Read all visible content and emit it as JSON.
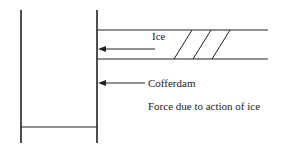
{
  "diagram": {
    "labels": {
      "ice": "Ice",
      "cofferdam": "Cofferdam",
      "caption": "Force due to action of ice"
    },
    "colors": {
      "line": "#222222",
      "background": "#ffffff"
    }
  }
}
